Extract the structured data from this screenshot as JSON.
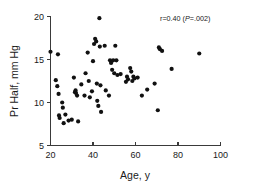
{
  "chart_data": {
    "type": "scatter",
    "title": "",
    "xlabel": "Age, y",
    "ylabel": "Pr Half, mm Hg",
    "xlim": [
      20,
      100
    ],
    "ylim": [
      5,
      20
    ],
    "xticks": [
      20,
      40,
      60,
      80,
      100
    ],
    "yticks": [
      5,
      10,
      15,
      20
    ],
    "xtick_labels": [
      "20",
      "40",
      "60",
      "80",
      "100"
    ],
    "ytick_labels": [
      "5",
      "10",
      "15",
      "20"
    ],
    "grid": false,
    "legend": null,
    "marker": "filled-circle",
    "marker_color": "#111111",
    "annotation": {
      "text": "r=0.40 (P=.002)",
      "r_part": "r=0.40 (",
      "p_italic": "P",
      "p_rest": "=.002)",
      "x": 72,
      "y": 19.2
    },
    "points": [
      {
        "x": 20.0,
        "y": 15.9
      },
      {
        "x": 22.5,
        "y": 12.6
      },
      {
        "x": 23.2,
        "y": 11.9
      },
      {
        "x": 23.5,
        "y": 15.6
      },
      {
        "x": 23.8,
        "y": 11.0
      },
      {
        "x": 24.0,
        "y": 8.5
      },
      {
        "x": 24.3,
        "y": 8.2
      },
      {
        "x": 25.5,
        "y": 10.0
      },
      {
        "x": 25.8,
        "y": 9.4
      },
      {
        "x": 26.2,
        "y": 7.6
      },
      {
        "x": 27.0,
        "y": 8.6
      },
      {
        "x": 28.5,
        "y": 7.9
      },
      {
        "x": 30.0,
        "y": 8.0
      },
      {
        "x": 31.0,
        "y": 12.9
      },
      {
        "x": 31.5,
        "y": 11.2
      },
      {
        "x": 31.8,
        "y": 11.4
      },
      {
        "x": 32.0,
        "y": 11.1
      },
      {
        "x": 32.5,
        "y": 10.8
      },
      {
        "x": 33.0,
        "y": 7.8
      },
      {
        "x": 34.5,
        "y": 12.1
      },
      {
        "x": 36.0,
        "y": 10.8
      },
      {
        "x": 36.5,
        "y": 13.4
      },
      {
        "x": 37.5,
        "y": 15.8
      },
      {
        "x": 38.0,
        "y": 12.5
      },
      {
        "x": 38.5,
        "y": 10.6
      },
      {
        "x": 39.5,
        "y": 11.3
      },
      {
        "x": 40.0,
        "y": 14.8
      },
      {
        "x": 40.5,
        "y": 16.8
      },
      {
        "x": 41.0,
        "y": 17.4
      },
      {
        "x": 41.5,
        "y": 17.1
      },
      {
        "x": 41.8,
        "y": 12.2
      },
      {
        "x": 42.0,
        "y": 10.2
      },
      {
        "x": 42.5,
        "y": 9.6
      },
      {
        "x": 43.0,
        "y": 19.8
      },
      {
        "x": 43.2,
        "y": 16.5
      },
      {
        "x": 43.5,
        "y": 12.0
      },
      {
        "x": 43.8,
        "y": 8.9
      },
      {
        "x": 45.5,
        "y": 16.6
      },
      {
        "x": 46.0,
        "y": 11.4
      },
      {
        "x": 47.5,
        "y": 10.8
      },
      {
        "x": 48.0,
        "y": 14.9
      },
      {
        "x": 48.5,
        "y": 14.6
      },
      {
        "x": 49.0,
        "y": 13.8
      },
      {
        "x": 49.5,
        "y": 14.9
      },
      {
        "x": 50.0,
        "y": 13.4
      },
      {
        "x": 50.5,
        "y": 16.6
      },
      {
        "x": 51.0,
        "y": 14.9
      },
      {
        "x": 51.5,
        "y": 13.2
      },
      {
        "x": 53.0,
        "y": 13.3
      },
      {
        "x": 55.5,
        "y": 12.4
      },
      {
        "x": 56.0,
        "y": 13.0
      },
      {
        "x": 56.5,
        "y": 12.7
      },
      {
        "x": 57.5,
        "y": 14.0
      },
      {
        "x": 58.0,
        "y": 13.6
      },
      {
        "x": 58.5,
        "y": 12.5
      },
      {
        "x": 59.0,
        "y": 13.0
      },
      {
        "x": 59.5,
        "y": 12.8
      },
      {
        "x": 61.0,
        "y": 12.9
      },
      {
        "x": 63.0,
        "y": 10.8
      },
      {
        "x": 65.5,
        "y": 11.5
      },
      {
        "x": 69.0,
        "y": 12.2
      },
      {
        "x": 70.5,
        "y": 9.1
      },
      {
        "x": 71.0,
        "y": 16.4
      },
      {
        "x": 71.5,
        "y": 16.2
      },
      {
        "x": 72.5,
        "y": 16.0
      },
      {
        "x": 77.0,
        "y": 13.9
      },
      {
        "x": 90.0,
        "y": 15.7
      }
    ]
  },
  "figure": {
    "background_color": "#ffffff",
    "axis_color": "#3a3a3a",
    "text_color": "#1a1a1a"
  }
}
